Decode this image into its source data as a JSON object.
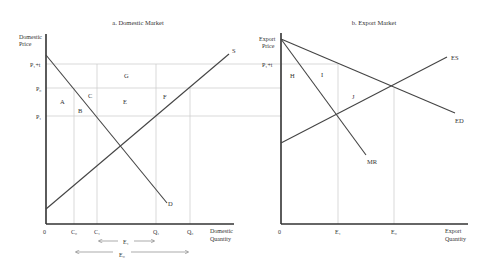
{
  "panel_a": {
    "title": "a.  Domestic Market",
    "y_axis_label_1": "Domestic",
    "y_axis_label_2": "Price",
    "x_axis_label_1": "Domestic",
    "x_axis_label_2": "Quantity",
    "origin": "0",
    "price_ticks": {
      "p1t": "P₁+t",
      "p0": "P₀",
      "p1": "P₁"
    },
    "qty_ticks": {
      "c0": "C₀",
      "c1": "C₁",
      "q1": "Q₁",
      "q0": "Q₀"
    },
    "curves": {
      "supply": "S",
      "demand": "D"
    },
    "areas": {
      "a": "A",
      "b": "B",
      "c": "C",
      "e": "E",
      "f": "F",
      "g": "G"
    },
    "spans": {
      "e1": "E₁",
      "e0": "E₀"
    }
  },
  "panel_b": {
    "title": "b.  Export Market",
    "y_axis_label_1": "Export",
    "y_axis_label_2": "Price",
    "x_axis_label_1": "Export",
    "x_axis_label_2": "Quantity",
    "origin": "0",
    "price_ticks": {
      "p1t": "P₁+t"
    },
    "qty_ticks": {
      "e1": "E₁",
      "e0": "E₀"
    },
    "curves": {
      "export_supply": "ES",
      "export_demand": "ED",
      "marginal_revenue": "MR"
    },
    "areas": {
      "h": "H",
      "i": "I",
      "j": "J"
    }
  }
}
